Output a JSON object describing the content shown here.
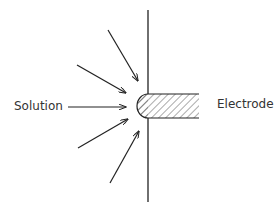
{
  "labels": {
    "solution": "Solution",
    "electrode": "Electrode"
  },
  "colors": {
    "line": "#222222",
    "text": "#333333",
    "background": "#ffffff"
  },
  "diagram": {
    "arrow_count": 5
  }
}
